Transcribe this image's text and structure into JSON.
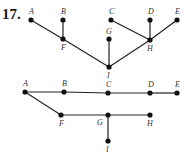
{
  "problem_number": "17.",
  "graphs": [
    {
      "name": "graph-1",
      "nodes": [
        {
          "id": "A",
          "x": 31,
          "y": 20,
          "lx": 29,
          "ly": 14
        },
        {
          "id": "B",
          "x": 63,
          "y": 20,
          "lx": 61,
          "ly": 14
        },
        {
          "id": "C",
          "x": 111,
          "y": 20,
          "lx": 109,
          "ly": 14
        },
        {
          "id": "D",
          "x": 150,
          "y": 20,
          "lx": 148,
          "ly": 14
        },
        {
          "id": "E",
          "x": 177,
          "y": 20,
          "lx": 175,
          "ly": 14
        },
        {
          "id": "F",
          "x": 63,
          "y": 39,
          "lx": 61,
          "ly": 50
        },
        {
          "id": "G",
          "x": 109,
          "y": 39,
          "lx": 106,
          "ly": 34
        },
        {
          "id": "H",
          "x": 150,
          "y": 40,
          "lx": 147,
          "ly": 51
        },
        {
          "id": "I",
          "x": 109,
          "y": 67,
          "lx": 107,
          "ly": 78
        }
      ],
      "edges": [
        [
          "A",
          "F"
        ],
        [
          "B",
          "F"
        ],
        [
          "F",
          "I"
        ],
        [
          "G",
          "I"
        ],
        [
          "I",
          "H"
        ],
        [
          "C",
          "H"
        ],
        [
          "D",
          "H"
        ],
        [
          "E",
          "H"
        ]
      ]
    },
    {
      "name": "graph-2",
      "nodes": [
        {
          "id": "A",
          "x": 25,
          "y": 92,
          "lx": 23,
          "ly": 86
        },
        {
          "id": "B",
          "x": 64,
          "y": 92,
          "lx": 62,
          "ly": 86
        },
        {
          "id": "C",
          "x": 108,
          "y": 93,
          "lx": 106,
          "ly": 87
        },
        {
          "id": "D",
          "x": 150,
          "y": 93,
          "lx": 148,
          "ly": 87
        },
        {
          "id": "E",
          "x": 177,
          "y": 93,
          "lx": 175,
          "ly": 87
        },
        {
          "id": "F",
          "x": 61,
          "y": 115,
          "lx": 59,
          "ly": 126
        },
        {
          "id": "G",
          "x": 108,
          "y": 115,
          "lx": 97,
          "ly": 125
        },
        {
          "id": "H",
          "x": 150,
          "y": 115,
          "lx": 147,
          "ly": 126
        },
        {
          "id": "I",
          "x": 108,
          "y": 141,
          "lx": 106,
          "ly": 152
        }
      ],
      "edges": [
        [
          "A",
          "B"
        ],
        [
          "B",
          "C"
        ],
        [
          "C",
          "D"
        ],
        [
          "D",
          "E"
        ],
        [
          "A",
          "F"
        ],
        [
          "F",
          "G"
        ],
        [
          "G",
          "H"
        ],
        [
          "G",
          "I"
        ]
      ]
    }
  ]
}
